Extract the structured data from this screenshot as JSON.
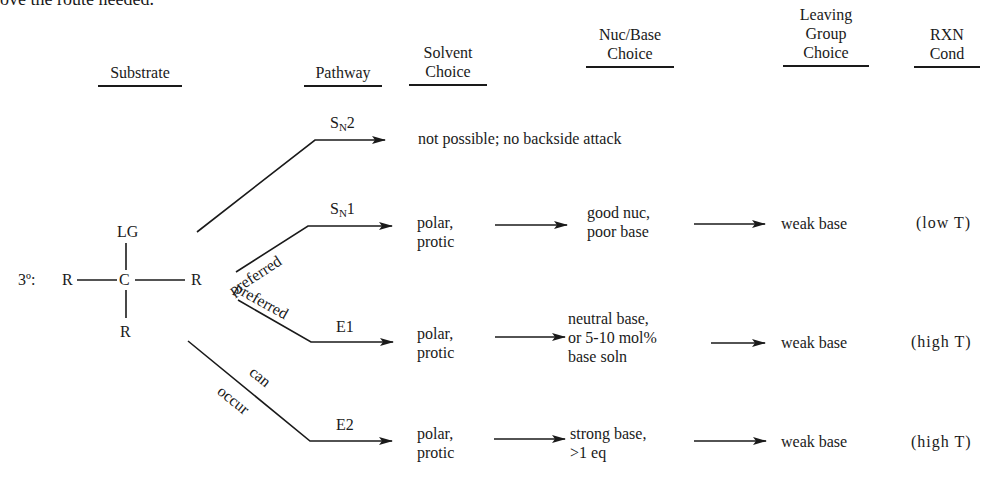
{
  "top_fragment": "ove the route needed.",
  "headers": {
    "substrate": "Substrate",
    "pathway": "Pathway",
    "solvent": [
      "Solvent",
      "Choice"
    ],
    "nuc_base": [
      "Nuc/Base",
      "Choice"
    ],
    "leaving_group": [
      "Leaving",
      "Group",
      "Choice"
    ],
    "rxn_cond": [
      "RXN",
      "Cond"
    ]
  },
  "substrate": {
    "label": "3º:",
    "top": "LG",
    "center": "C",
    "left": "R",
    "right": "R",
    "bottom": "R"
  },
  "branch_labels": {
    "sn1": "preferred",
    "e1": "preferred",
    "e2_line1": "can",
    "e2_line2": "occur"
  },
  "rows": [
    {
      "pathway_main": "S",
      "pathway_sub": "N",
      "pathway_num": "2",
      "result": "not possible; no backside attack"
    },
    {
      "pathway_main": "S",
      "pathway_sub": "N",
      "pathway_num": "1",
      "solvent": [
        "polar,",
        "protic"
      ],
      "nuc_base": [
        "good nuc,",
        "poor base"
      ],
      "leaving_group": "weak base",
      "cond": "(low T)"
    },
    {
      "pathway_main": "E1",
      "solvent": [
        "polar,",
        "protic"
      ],
      "nuc_base": [
        "neutral base,",
        "or 5-10 mol%",
        "base soln"
      ],
      "leaving_group": "weak base",
      "cond": "(high T)"
    },
    {
      "pathway_main": "E2",
      "solvent": [
        "polar,",
        "protic"
      ],
      "nuc_base": [
        "strong base,",
        ">1 eq"
      ],
      "leaving_group": "weak base",
      "cond": "(high T)"
    }
  ]
}
